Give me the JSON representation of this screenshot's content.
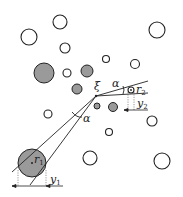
{
  "labels": {
    "xi": "ξ",
    "alpha_top": "α",
    "alpha_bottom": "α",
    "r1": "r",
    "r1_sub": "1",
    "r2": "r",
    "r2_sub": "2",
    "y1": "y",
    "y1_sub": "1",
    "y2": "y",
    "y2_sub": "2"
  },
  "colors": {
    "stroke": "#222222",
    "grey_fill": "#9a9a9a",
    "open_fill": "#ffffff"
  }
}
